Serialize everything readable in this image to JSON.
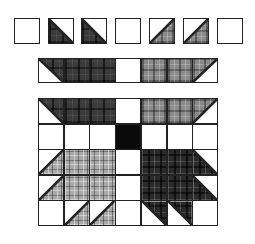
{
  "diagram": {
    "type": "quilt-block-assembly",
    "block_name": "Bear's Paw",
    "colors": {
      "outline": "#222222",
      "background": "#ffffff",
      "center": "#0a0a0a",
      "fabric_dark": "#3a3a3a",
      "fabric_medium": "#8a8a8a",
      "fabric_light": "#a8a8a8",
      "fabric_black": "#2a2a2a"
    },
    "units_row": {
      "description": "Individual units laid out separately",
      "cells": [
        {
          "kind": "plain",
          "fabric": "white"
        },
        {
          "kind": "hst",
          "fabric": "dark",
          "half": "bottom-left",
          "diagonal": "\\"
        },
        {
          "kind": "hst",
          "fabric": "dark",
          "half": "bottom-left",
          "diagonal": "\\"
        },
        {
          "kind": "plain",
          "fabric": "white"
        },
        {
          "kind": "hst",
          "fabric": "medium",
          "half": "bottom-right",
          "diagonal": "/"
        },
        {
          "kind": "hst",
          "fabric": "medium",
          "half": "bottom-right",
          "diagonal": "/"
        },
        {
          "kind": "plain",
          "fabric": "white"
        }
      ]
    },
    "strip_row": {
      "description": "Units sewn into a strip",
      "cells": [
        {
          "kind": "hst",
          "fabric": "dark",
          "half": "top-right",
          "diagonal": "\\"
        },
        {
          "kind": "plain",
          "fabric": "dark"
        },
        {
          "kind": "plain",
          "fabric": "dark"
        },
        {
          "kind": "plain",
          "fabric": "white"
        },
        {
          "kind": "plain",
          "fabric": "medium"
        },
        {
          "kind": "plain",
          "fabric": "medium"
        },
        {
          "kind": "hst",
          "fabric": "medium",
          "half": "top-left",
          "diagonal": "/"
        }
      ]
    },
    "block_grid": {
      "description": "Completed 7x5 block",
      "columns": 7,
      "rows": [
        [
          {
            "kind": "hst",
            "fabric": "dark",
            "half": "top-right"
          },
          {
            "kind": "plain",
            "fabric": "dark"
          },
          {
            "kind": "plain",
            "fabric": "dark"
          },
          {
            "kind": "plain",
            "fabric": "white"
          },
          {
            "kind": "plain",
            "fabric": "medium"
          },
          {
            "kind": "plain",
            "fabric": "medium"
          },
          {
            "kind": "hst",
            "fabric": "medium",
            "half": "top-left"
          }
        ],
        [
          {
            "kind": "plain",
            "fabric": "white"
          },
          {
            "kind": "plain",
            "fabric": "white"
          },
          {
            "kind": "plain",
            "fabric": "white"
          },
          {
            "kind": "plain",
            "fabric": "center"
          },
          {
            "kind": "plain",
            "fabric": "white"
          },
          {
            "kind": "plain",
            "fabric": "white"
          },
          {
            "kind": "plain",
            "fabric": "white"
          }
        ],
        [
          {
            "kind": "hst",
            "fabric": "light",
            "half": "bottom-right"
          },
          {
            "kind": "plain",
            "fabric": "light"
          },
          {
            "kind": "plain",
            "fabric": "light"
          },
          {
            "kind": "plain",
            "fabric": "white"
          },
          {
            "kind": "plain",
            "fabric": "black"
          },
          {
            "kind": "plain",
            "fabric": "black"
          },
          {
            "kind": "hst",
            "fabric": "black",
            "half": "bottom-left"
          }
        ],
        [
          {
            "kind": "hst",
            "fabric": "light",
            "half": "bottom-right"
          },
          {
            "kind": "plain",
            "fabric": "light"
          },
          {
            "kind": "plain",
            "fabric": "light"
          },
          {
            "kind": "plain",
            "fabric": "white"
          },
          {
            "kind": "plain",
            "fabric": "black"
          },
          {
            "kind": "plain",
            "fabric": "black"
          },
          {
            "kind": "hst",
            "fabric": "black",
            "half": "bottom-left"
          }
        ],
        [
          {
            "kind": "plain",
            "fabric": "white"
          },
          {
            "kind": "hst",
            "fabric": "light",
            "half": "bottom-right"
          },
          {
            "kind": "hst",
            "fabric": "light",
            "half": "bottom-right"
          },
          {
            "kind": "plain",
            "fabric": "white"
          },
          {
            "kind": "hst",
            "fabric": "black",
            "half": "top-right"
          },
          {
            "kind": "hst",
            "fabric": "black",
            "half": "top-right"
          },
          {
            "kind": "plain",
            "fabric": "white"
          }
        ]
      ]
    },
    "layout": {
      "units_row": {
        "x": [
          14,
          48,
          81,
          115,
          149,
          183,
          217
        ],
        "y": 18,
        "size": 26
      },
      "strip_row": {
        "x0": 38,
        "y": 58,
        "cell_w": 25.7,
        "cell_h": 25
      },
      "block_grid": {
        "x0": 38,
        "y0": 98,
        "cell_w": 25.7,
        "cell_h": 25.6
      }
    }
  }
}
